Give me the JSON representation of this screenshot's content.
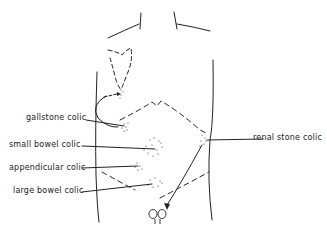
{
  "diagram": {
    "type": "anatomical-torso-outline",
    "labels": {
      "gallstone": "gallstone colic",
      "small_bowel": "small bowel colic",
      "appendicular": "appendicular colic",
      "large_bowel": "large bowel colic",
      "renal": "renal stone colic"
    },
    "colors": {
      "line": "#222222",
      "background": "#ffffff"
    }
  }
}
